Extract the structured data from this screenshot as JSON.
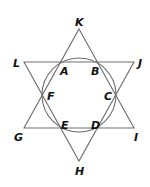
{
  "diagram": {
    "stroke_color": "#6e6e6e",
    "circle": {
      "cx": 79,
      "cy": 95,
      "r": 37
    },
    "triangle_up": {
      "name": "KIG",
      "points": [
        [
          79,
          29
        ],
        [
          134,
          128
        ],
        [
          24,
          128
        ]
      ]
    },
    "triangle_down": {
      "name": "LJH",
      "points": [
        [
          24,
          62
        ],
        [
          134,
          62
        ],
        [
          79,
          161
        ]
      ]
    },
    "labels": [
      {
        "text": "K",
        "x": 75,
        "y": 26
      },
      {
        "text": "L",
        "x": 13,
        "y": 67
      },
      {
        "text": "J",
        "x": 138,
        "y": 67
      },
      {
        "text": "A",
        "x": 60,
        "y": 75
      },
      {
        "text": "B",
        "x": 91,
        "y": 75
      },
      {
        "text": "F",
        "x": 47,
        "y": 100
      },
      {
        "text": "C",
        "x": 104,
        "y": 100
      },
      {
        "text": "E",
        "x": 61,
        "y": 129
      },
      {
        "text": "D",
        "x": 91,
        "y": 129
      },
      {
        "text": "G",
        "x": 14,
        "y": 141
      },
      {
        "text": "I",
        "x": 134,
        "y": 141
      },
      {
        "text": "H",
        "x": 75,
        "y": 175
      }
    ]
  }
}
